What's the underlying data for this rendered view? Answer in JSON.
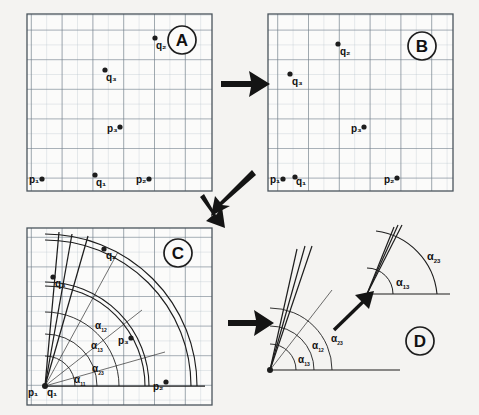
{
  "figure": {
    "background_color": "#f4f3f1",
    "ink_color": "#2b2b2b",
    "grid_minor_color": "#b9c3cc",
    "grid_major_color": "#6d7a85"
  },
  "panels": [
    {
      "id": "A",
      "badge": "A",
      "caption": "Original point configuration",
      "grid": {
        "minor_cells_x": 12,
        "minor_cells_y": 11,
        "major_every": 2
      },
      "points": [
        {
          "label": "p₁",
          "name": "p1",
          "x": 0.08,
          "y": 0.93,
          "label_side": "left"
        },
        {
          "label": "p₂",
          "name": "p2",
          "x": 0.66,
          "y": 0.93,
          "label_side": "left"
        },
        {
          "label": "p₃",
          "name": "p3",
          "x": 0.5,
          "y": 0.64,
          "label_side": "left"
        },
        {
          "label": "q₁",
          "name": "q1",
          "x": 0.38,
          "y": 0.92,
          "label_side": "right"
        },
        {
          "label": "q₂",
          "name": "q2",
          "x": 0.72,
          "y": 0.13,
          "label_side": "right"
        },
        {
          "label": "q₃",
          "name": "q3",
          "x": 0.42,
          "y": 0.3,
          "label_side": "right"
        }
      ]
    },
    {
      "id": "B",
      "badge": "B",
      "caption": "Translated point configuration",
      "grid": {
        "minor_cells_x": 12,
        "minor_cells_y": 11,
        "major_every": 2
      },
      "points": [
        {
          "label": "p₁",
          "name": "p1",
          "x": 0.08,
          "y": 0.93,
          "label_side": "left"
        },
        {
          "label": "p₂",
          "name": "p2",
          "x": 0.7,
          "y": 0.93,
          "label_side": "left"
        },
        {
          "label": "p₃",
          "name": "p3",
          "x": 0.45,
          "y": 0.64,
          "label_side": "left"
        },
        {
          "label": "q₁",
          "name": "q1",
          "x": 0.17,
          "y": 0.93,
          "label_side": "left"
        },
        {
          "label": "q₂",
          "name": "q2",
          "x": 0.4,
          "y": 0.19,
          "label_side": "right"
        },
        {
          "label": "q₃",
          "name": "q3",
          "x": 0.13,
          "y": 0.33,
          "label_side": "right"
        }
      ]
    },
    {
      "id": "C",
      "badge": "C",
      "caption": "Angular sectors and radial arcs from the common origin",
      "grid": {
        "minor_cells_x": 12,
        "minor_cells_y": 11,
        "major_every": 2
      },
      "origin": {
        "label": "p₁",
        "second_label": "q₁",
        "x": 0.1,
        "y": 0.93
      },
      "points": [
        {
          "label": "p₂",
          "name": "p2",
          "x": 0.76,
          "y": 0.93,
          "label_side": "left"
        },
        {
          "label": "p₃",
          "name": "p3",
          "x": 0.55,
          "y": 0.58,
          "label_side": "left"
        },
        {
          "label": "q₂",
          "name": "q2",
          "x": 0.43,
          "y": 0.13,
          "label_side": "right"
        },
        {
          "label": "q₃",
          "name": "q3",
          "x": 0.15,
          "y": 0.33,
          "label_side": "right"
        }
      ],
      "angle_labels": [
        {
          "text": "α",
          "sub": "12",
          "x": 0.33,
          "y": 0.6
        },
        {
          "text": "α",
          "sub": "13",
          "x": 0.31,
          "y": 0.72
        },
        {
          "text": "α",
          "sub": "23",
          "x": 0.33,
          "y": 0.85
        },
        {
          "text": "α",
          "sub": "11",
          "x": 0.25,
          "y": 0.94
        }
      ],
      "rays_deg": [
        84,
        79,
        73,
        57,
        38,
        20,
        0
      ],
      "arc_radii": [
        0.16,
        0.26,
        0.36,
        0.5,
        0.7,
        0.9
      ]
    },
    {
      "id": "D",
      "badge": "D",
      "caption": "Detail of the angular fan with magnified inset",
      "angle_labels": [
        {
          "text": "α",
          "sub": "13",
          "x": 0.3,
          "y": 0.72
        },
        {
          "text": "α",
          "sub": "12",
          "x": 0.44,
          "y": 0.62
        },
        {
          "text": "α",
          "sub": "23",
          "x": 0.56,
          "y": 0.58
        }
      ],
      "inset": {
        "angle_labels": [
          {
            "text": "α",
            "sub": "13",
            "x": 0.4,
            "y": 0.66
          },
          {
            "text": "α",
            "sub": "23",
            "x": 0.72,
            "y": 0.34
          }
        ]
      }
    }
  ],
  "arrows": [
    {
      "name": "arrow-a-to-b",
      "direction": "right"
    },
    {
      "name": "arrow-b-to-c",
      "direction": "down-left"
    },
    {
      "name": "arrow-c-to-d",
      "direction": "right"
    },
    {
      "name": "arrow-zoom-to-inset",
      "direction": "up-right"
    }
  ]
}
